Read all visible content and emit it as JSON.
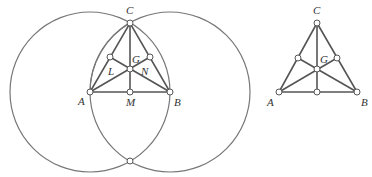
{
  "figures": [
    {
      "name": "construction",
      "points": {
        "A": {
          "label": "A",
          "x": 90,
          "y": 92
        },
        "B": {
          "label": "B",
          "x": 170,
          "y": 92
        },
        "C": {
          "label": "C",
          "x": 130,
          "y": 23
        },
        "G": {
          "label": "G",
          "x": 130,
          "y": 69
        },
        "L": {
          "label": "L",
          "x": 110,
          "y": 57
        },
        "N": {
          "label": "N",
          "x": 150,
          "y": 57
        },
        "M": {
          "label": "M",
          "x": 130,
          "y": 92
        },
        "D": {
          "label": "",
          "x": 130,
          "y": 161
        }
      },
      "circles": [
        {
          "center": "A",
          "r": 80
        },
        {
          "center": "B",
          "r": 80
        }
      ]
    },
    {
      "name": "triangle",
      "points": {
        "A": {
          "label": "A",
          "x": 279,
          "y": 92
        },
        "B": {
          "label": "B",
          "x": 357,
          "y": 92
        },
        "C": {
          "label": "C",
          "x": 317,
          "y": 23
        },
        "G": {
          "label": "G",
          "x": 317,
          "y": 69
        }
      }
    }
  ]
}
